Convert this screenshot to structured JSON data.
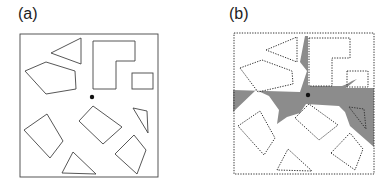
{
  "panels": [
    {
      "label": "(a)",
      "description": "Polygonal obstacles in a square environment with a point viewer"
    },
    {
      "label": "(b)",
      "description": "Dotted obstacle boundaries with gray visibility region from the viewer point"
    }
  ],
  "colors": {
    "stroke": "#333333",
    "visibility": "#8c8c8c",
    "point": "#111111"
  }
}
